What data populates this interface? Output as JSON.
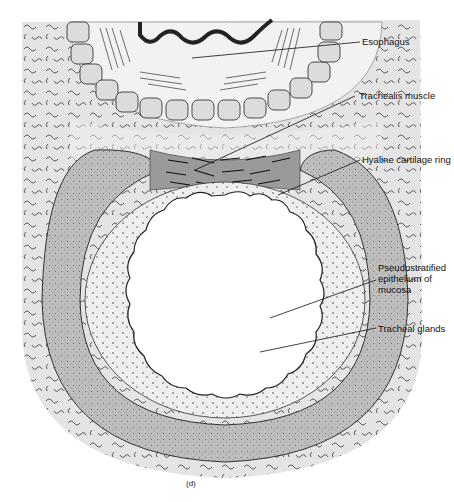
{
  "figure": {
    "caption": "(d)"
  },
  "labels": [
    {
      "id": "esophagus",
      "text": "Esophagus"
    },
    {
      "id": "trachealis",
      "text": "Trachealis muscle"
    },
    {
      "id": "cartilage",
      "text": "Hyaline cartilage ring"
    },
    {
      "id": "epithelium",
      "text": "Pseudostratified\nepithelium of\nmucosa"
    },
    {
      "id": "glands",
      "text": "Tracheal glands"
    }
  ],
  "colors": {
    "connective": "#e6e6e6",
    "cartilage": "#bdbdbd",
    "mucosa": "#dcdcdc",
    "muscle": "#9a9a9a",
    "lumen": "#ffffff",
    "ink": "#111111"
  }
}
